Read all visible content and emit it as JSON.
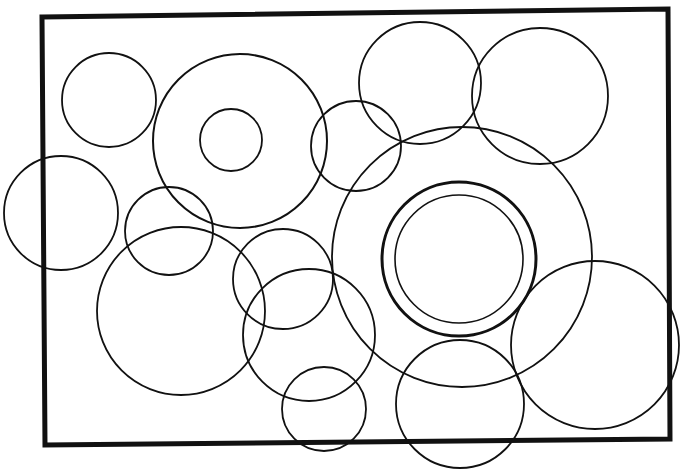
{
  "figure": {
    "width": 690,
    "height": 475,
    "background": "#ffffff",
    "stroke_color": "#111111",
    "frame": {
      "points": "42,17 668,9 670,439 45,445",
      "stroke_width": 5
    },
    "circles": [
      {
        "name": "circle-top-left",
        "cx": 109,
        "cy": 100,
        "r": 47,
        "w": 1.8
      },
      {
        "name": "circle-ring-outer-left",
        "cx": 240,
        "cy": 141,
        "r": 87,
        "w": 2
      },
      {
        "name": "circle-ring-inner-left",
        "cx": 231,
        "cy": 140,
        "r": 31,
        "w": 1.8
      },
      {
        "name": "circle-left-edge",
        "cx": 61,
        "cy": 213,
        "r": 57,
        "w": 1.8
      },
      {
        "name": "circle-small-left-mid",
        "cx": 169,
        "cy": 231,
        "r": 44,
        "w": 1.8
      },
      {
        "name": "circle-large-lower-left",
        "cx": 181,
        "cy": 311,
        "r": 84,
        "w": 1.8
      },
      {
        "name": "circle-center-small",
        "cx": 283,
        "cy": 279,
        "r": 50,
        "w": 1.8
      },
      {
        "name": "circle-center-lower",
        "cx": 309,
        "cy": 335,
        "r": 66,
        "w": 1.8
      },
      {
        "name": "circle-bottom-small",
        "cx": 324,
        "cy": 409,
        "r": 42,
        "w": 1.8
      },
      {
        "name": "circle-upper-mid",
        "cx": 356,
        "cy": 146,
        "r": 45,
        "w": 1.8
      },
      {
        "name": "circle-top-center",
        "cx": 420,
        "cy": 83,
        "r": 61,
        "w": 1.8
      },
      {
        "name": "circle-top-right",
        "cx": 540,
        "cy": 96,
        "r": 68,
        "w": 1.8
      },
      {
        "name": "circle-large-center",
        "cx": 462,
        "cy": 257,
        "r": 130,
        "w": 1.8
      },
      {
        "name": "circle-bullseye-outer",
        "cx": 459,
        "cy": 259,
        "r": 77,
        "w": 3
      },
      {
        "name": "circle-bullseye-inner",
        "cx": 459,
        "cy": 259,
        "r": 64,
        "w": 1.6
      },
      {
        "name": "circle-bottom-center",
        "cx": 460,
        "cy": 404,
        "r": 64,
        "w": 1.8
      },
      {
        "name": "circle-right",
        "cx": 595,
        "cy": 345,
        "r": 84,
        "w": 1.8
      }
    ]
  }
}
